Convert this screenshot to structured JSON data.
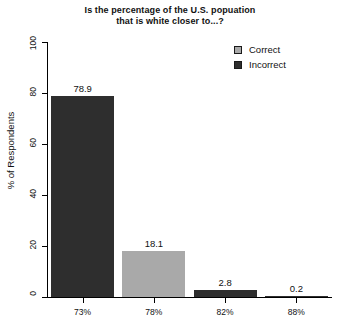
{
  "chart_data": {
    "type": "bar",
    "title": "Is the percentage of the U.S. popuation\nthat is white closer to...?",
    "xlabel": "",
    "ylabel": "% of Respondents",
    "categories": [
      "73%",
      "78%",
      "82%",
      "88%"
    ],
    "values": [
      78.9,
      18.1,
      2.8,
      0.2
    ],
    "value_labels": [
      "78.9",
      "18.1",
      "2.8",
      "0.2"
    ],
    "bar_groups": [
      "Incorrect",
      "Correct",
      "Incorrect",
      "Incorrect"
    ],
    "ylim": [
      0,
      100
    ],
    "yticks": [
      0,
      20,
      40,
      60,
      80,
      100
    ],
    "ytick_labels": [
      "0",
      "20",
      "40",
      "60",
      "80",
      "100"
    ],
    "grid": false,
    "legend_position": "top-right",
    "series": [
      {
        "name": "Correct",
        "color": "#a9a9a9",
        "values": [
          null,
          18.1,
          null,
          null
        ]
      },
      {
        "name": "Incorrect",
        "color": "#2e2e2e",
        "values": [
          78.9,
          null,
          2.8,
          0.2
        ]
      }
    ]
  },
  "legend": {
    "items": [
      {
        "label": "Correct",
        "color": "#a9a9a9"
      },
      {
        "label": "Incorrect",
        "color": "#2e2e2e"
      }
    ]
  },
  "colors": {
    "correct": "#a9a9a9",
    "incorrect": "#2e2e2e",
    "axis": "#000000",
    "background": "#ffffff"
  }
}
